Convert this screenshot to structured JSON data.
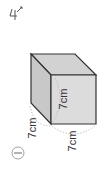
{
  "handwritten_mark": "4",
  "figure": {
    "shape": "cube",
    "labels": {
      "height": "7cm",
      "depth": "7cm",
      "width": "7cm"
    },
    "problem_number": "1",
    "colors": {
      "face_front": "#dcdcdc",
      "face_top": "#d2d2d2",
      "face_left": "#c8c8c8",
      "edge": "#333333",
      "arc": "#b0b0b0"
    }
  }
}
